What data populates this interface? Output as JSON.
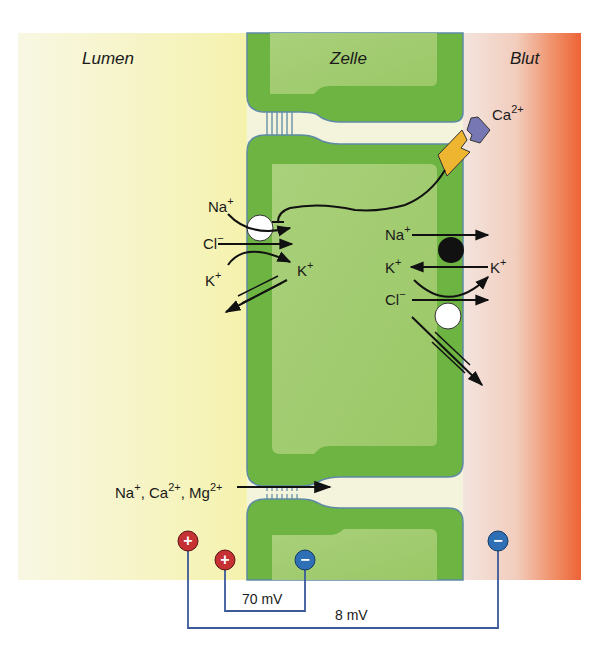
{
  "regions": {
    "lumen": "Lumen",
    "cell": "Zelle",
    "blood": "Blut"
  },
  "colors": {
    "lumen_gradient": [
      "#f7f6e0",
      "#f6f3b0"
    ],
    "blood_gradient": [
      "#f3e2dc",
      "#ee6a3e"
    ],
    "cell_membrane": "#6db443",
    "cell_cytoplasm": "#a9cf76",
    "cell_outline": "#5d8aa5",
    "receptor": "#eeb531",
    "ligand": "#7777b3",
    "positive_electrode": "#c63233",
    "negative_electrode": "#2e6fb6",
    "wire": "#3a5a9a"
  },
  "ions": {
    "ca_ligand": {
      "base": "Ca",
      "sup": "2+"
    },
    "apical": {
      "na": {
        "base": "Na",
        "sup": "+"
      },
      "cl": {
        "base": "Cl",
        "sup": "−"
      },
      "k_in": {
        "base": "K",
        "sup": "+"
      },
      "k_out": {
        "base": "K",
        "sup": "+"
      }
    },
    "basolateral": {
      "na": {
        "base": "Na",
        "sup": "+"
      },
      "k_left": {
        "base": "K",
        "sup": "+"
      },
      "k_right": {
        "base": "K",
        "sup": "+"
      },
      "cl": {
        "base": "Cl",
        "sup": "−"
      }
    },
    "paracellular": {
      "na": {
        "base": "Na",
        "sup": "+"
      },
      "ca": {
        "base": "Ca",
        "sup": "2+"
      },
      "mg": {
        "base": "Mg",
        "sup": "2+"
      },
      "sep": ", "
    }
  },
  "electrodes": {
    "outer_plus": "+",
    "inner_plus": "+",
    "inner_minus": "−",
    "outer_minus": "−"
  },
  "voltages": {
    "membrane": "70 mV",
    "transepithelial": "8 mV"
  }
}
